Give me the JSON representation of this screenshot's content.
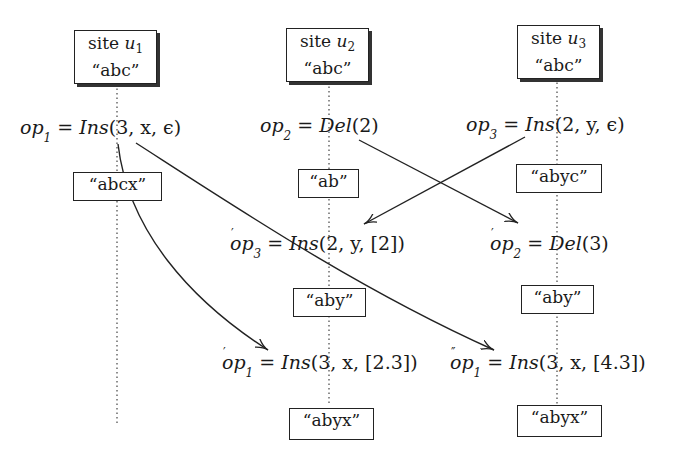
{
  "sites": [
    {
      "id": "u1",
      "label_prefix": "site ",
      "var": "u",
      "sub": "1",
      "initial": "“abc”"
    },
    {
      "id": "u2",
      "label_prefix": "site ",
      "var": "u",
      "sub": "2",
      "initial": "“abc”"
    },
    {
      "id": "u3",
      "label_prefix": "site ",
      "var": "u",
      "sub": "3",
      "initial": "“abc”"
    }
  ],
  "operations": {
    "op1": {
      "name": "op",
      "sub": "1",
      "prime": "",
      "eq": " = ",
      "fn": "Ins",
      "args": "(3, x, ϵ)"
    },
    "op2": {
      "name": "op",
      "sub": "2",
      "prime": "",
      "eq": " = ",
      "fn": "Del",
      "args": "(2)"
    },
    "op3": {
      "name": "op",
      "sub": "3",
      "prime": "",
      "eq": " = ",
      "fn": "Ins",
      "args": "(2, y, ϵ)"
    },
    "op3p": {
      "name": "op",
      "sub": "3",
      "prime": "′",
      "eq": " = ",
      "fn": "Ins",
      "args": "(2, y, [2])"
    },
    "op2p": {
      "name": "op",
      "sub": "2",
      "prime": "′",
      "eq": " = ",
      "fn": "Del",
      "args": "(3)"
    },
    "op1p": {
      "name": "op",
      "sub": "1",
      "prime": "′",
      "eq": " = ",
      "fn": "Ins",
      "args": "(3, x, [2.3])"
    },
    "op1pp": {
      "name": "op",
      "sub": "1",
      "prime": "″",
      "eq": " = ",
      "fn": "Ins",
      "args": "(3, x, [4.3])"
    }
  },
  "states": {
    "u1_after_op1": "“abcx”",
    "u2_after_op2": "“ab”",
    "u3_after_op3": "“abyc”",
    "u2_after_op3p": "“aby”",
    "u3_after_op2p": "“aby”",
    "u2_after_op1p": "“abyx”",
    "u3_after_op1pp": "“abyx”"
  }
}
